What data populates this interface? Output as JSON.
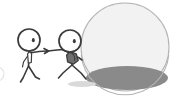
{
  "illustration": {
    "title": "Two stick figures and a large sphere",
    "style": "hand-drawn doodle",
    "background_color": "#ffffff",
    "ink_color": "#3b3b3b"
  },
  "figures": {
    "left": {
      "name": "Restraining stick figure",
      "pose": "standing, leaning back, arm extended forward",
      "accessory": "necktie",
      "accessory_color": "#ffffff",
      "eye_count": 1,
      "head_center": {
        "x": 29,
        "y": 40
      },
      "head_radius": 11
    },
    "right": {
      "name": "Lunging stick figure",
      "pose": "running forward toward the sphere",
      "accessory": "backpack",
      "accessory_color": "#6f6f6f",
      "eye_count": 1,
      "head_center": {
        "x": 70,
        "y": 41
      },
      "head_radius": 11
    },
    "link": {
      "name": "Held arm connection",
      "description": "left figure's hand grips the right figure's arm"
    }
  },
  "sphere": {
    "name": "Large sphere",
    "center": {
      "x": 125,
      "y": 47
    },
    "radius": 44,
    "fill_color": "#f2f2f2",
    "outline_color": "#b4b4b4",
    "pool": {
      "name": "Shadow pool inside sphere",
      "center": {
        "x": 127,
        "y": 78
      },
      "rx": 41,
      "ry": 12,
      "color": "#8a8a8a"
    }
  },
  "ghost_arc": {
    "name": "Partial circle at left edge",
    "center": {
      "x": -3,
      "y": 74
    },
    "radius": 7,
    "color": "#e2e2e2"
  },
  "ground_smudge": {
    "name": "Ground shadow under right figure",
    "center": {
      "x": 82,
      "y": 84
    },
    "rx": 14,
    "ry": 3,
    "color": "#d9d9d9"
  }
}
